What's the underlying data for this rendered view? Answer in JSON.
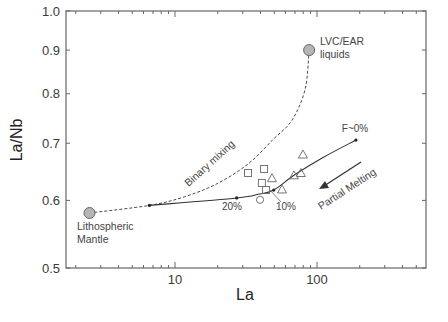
{
  "chart_data": {
    "type": "scatter",
    "title": "",
    "xlabel": "La",
    "ylabel": "La/Nb",
    "xscale": "log",
    "yscale": "log",
    "xlim": [
      1.7,
      586
    ],
    "ylim": [
      0.5,
      1.0
    ],
    "xticks": [
      {
        "value": 10,
        "label": "10"
      },
      {
        "value": 100,
        "label": "100"
      }
    ],
    "yticks": [
      {
        "value": 0.5,
        "label": "0.5"
      },
      {
        "value": 0.6,
        "label": "0.6"
      },
      {
        "value": 0.7,
        "label": "0.7"
      },
      {
        "value": 0.8,
        "label": "0.8"
      },
      {
        "value": 0.9,
        "label": "0.9"
      },
      {
        "value": 1.0,
        "label": "1.0"
      }
    ],
    "grid": false,
    "legend": null,
    "endmembers": [
      {
        "name": "Lithospheric Mantle",
        "label_lines": [
          "Lithospheric",
          "Mantle"
        ],
        "x": 2.5,
        "y": 0.58
      },
      {
        "name": "LVC/EAR liquids",
        "label_lines": [
          "LVC/EAR",
          "liquids"
        ],
        "x": 88,
        "y": 0.9
      }
    ],
    "series": [
      {
        "name": "squares",
        "marker": "square",
        "points": [
          [
            32.7,
            0.646
          ],
          [
            42.4,
            0.653
          ],
          [
            40.9,
            0.629
          ],
          [
            43.8,
            0.617
          ]
        ]
      },
      {
        "name": "triangles",
        "marker": "triangle",
        "points": [
          [
            48.2,
            0.637
          ],
          [
            56.7,
            0.618
          ],
          [
            68.8,
            0.642
          ],
          [
            77.0,
            0.646
          ],
          [
            79.6,
            0.679
          ]
        ]
      },
      {
        "name": "circle",
        "marker": "circle",
        "points": [
          [
            39.7,
            0.601
          ]
        ]
      }
    ],
    "curves": [
      {
        "name": "Binary mixing",
        "style": "dashed",
        "points": [
          [
            2.5,
            0.58
          ],
          [
            6.6,
            0.592
          ],
          [
            11.7,
            0.606
          ],
          [
            19.9,
            0.628
          ],
          [
            32.7,
            0.662
          ],
          [
            49.4,
            0.708
          ],
          [
            66.7,
            0.745
          ],
          [
            82.5,
            0.81
          ],
          [
            88,
            0.9
          ]
        ]
      },
      {
        "name": "Partial Melting",
        "style": "solid",
        "points": [
          [
            6.6,
            0.592
          ],
          [
            27.2,
            0.604
          ],
          [
            38.4,
            0.61
          ],
          [
            49.6,
            0.617
          ],
          [
            68.8,
            0.642
          ],
          [
            111,
            0.674
          ],
          [
            188,
            0.706
          ]
        ],
        "markers": [
          {
            "x": 6.6,
            "y": 0.592,
            "label": ""
          },
          {
            "x": 27.2,
            "y": 0.604,
            "label": "20%"
          },
          {
            "x": 49.6,
            "y": 0.617,
            "label": "10%"
          },
          {
            "x": 188,
            "y": 0.706,
            "label": "F~0%"
          }
        ]
      }
    ],
    "annotations": [
      {
        "text": "Binary mixing",
        "rotation": -40
      },
      {
        "text": "Partial Melting",
        "rotation": -33,
        "arrow": "toward lower La"
      },
      {
        "text": "20%"
      },
      {
        "text": "10%"
      },
      {
        "text": "F~0%"
      }
    ]
  },
  "labels": {
    "xlabel": "La",
    "ylabel": "La/Nb",
    "binary_mixing": "Binary mixing",
    "partial_melting": "Partial Melting",
    "pct20": "20%",
    "pct10": "10%",
    "f0": "F~0%",
    "lvc_line1": "LVC/EAR",
    "lvc_line2": "liquids",
    "lm_line1": "Lithospheric",
    "lm_line2": "Mantle"
  },
  "colors": {
    "axis": "#555555",
    "curve": "#333333",
    "marker_stroke": "#555555",
    "endmember_fill": "#b5b5b5"
  }
}
